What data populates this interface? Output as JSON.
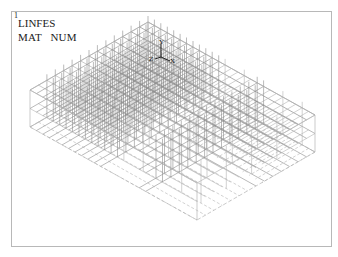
{
  "window": {
    "number": "1",
    "title": "LINFES",
    "subtitle": "MAT   NUM"
  },
  "triad": {
    "y_label": "Y",
    "z_label": "Z",
    "x_label": "X"
  },
  "colors": {
    "background": "#ffffff",
    "frame": "#b8b8b8",
    "element": "#8c8c8c",
    "element_light": "#b4b4b4",
    "text": "#1a1a1a"
  },
  "model": {
    "type": "3D wireframe of line elements (isometric view)",
    "top_vertex": [
      148,
      22
    ],
    "left_vertex": [
      30,
      90
    ],
    "right_vertex": [
      315,
      115
    ],
    "front_vertex": [
      200,
      190
    ],
    "depth": 37,
    "divisions_long": 26,
    "divisions_short": 14
  }
}
